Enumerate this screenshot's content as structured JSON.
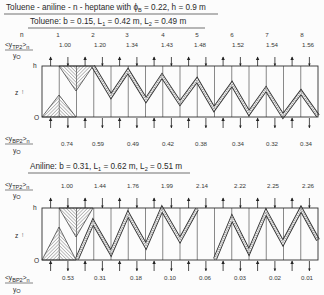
{
  "figure": {
    "title": {
      "pre": "Toluene - aniline - n - heptane with ϕ",
      "sub": "B",
      "post": " = 0.22, h = 0.9 m"
    },
    "axis": {
      "h_label": "h",
      "zero_label": "O",
      "z_label": "z",
      "z_arrow": "↑"
    },
    "row_labels": {
      "n": "n",
      "top": {
        "open": "<y",
        "sub": "TP2",
        "close": ">",
        "idx": "n",
        "den": "y",
        "den_sub": "O"
      },
      "bottom": {
        "open": "<y",
        "sub": "BP2",
        "close": ">",
        "idx": "n",
        "den": "y",
        "den_sub": "O"
      }
    },
    "stages": [
      "1",
      "2",
      "3",
      "4",
      "5",
      "6",
      "7",
      "8"
    ],
    "panels": [
      {
        "name": "Toluene",
        "subtitle": {
          "p1": "Toluene: b = 0.15, L",
          "s1": "1",
          "p2": " = 0.42 m, L",
          "s2": "2",
          "p3": " = 0.49 m"
        },
        "y_tp2": [
          "1.00",
          "1.20",
          "1.34",
          "1.43",
          "1.48",
          "1.52",
          "1.54",
          "1.56"
        ],
        "y_bp2": [
          "0.74",
          "0.59",
          "0.49",
          "0.42",
          "0.38",
          "0.34",
          "0.32",
          "0.34"
        ]
      },
      {
        "name": "Aniline",
        "subtitle": {
          "p1": "Aniline: b = 0.31, L",
          "s1": "1",
          "p2": " = 0.62 m, L",
          "s2": "2",
          "p3": " = 0.51 m"
        },
        "y_tp2": [
          "1.00",
          "1.44",
          "1.76",
          "1.99",
          "2.14",
          "2.22",
          "2.25",
          "2.26"
        ],
        "y_bp2": [
          "0.53",
          "0.31",
          "0.18",
          "0.10",
          "0.06",
          "0.03",
          "0.02",
          "0.01"
        ]
      }
    ]
  }
}
